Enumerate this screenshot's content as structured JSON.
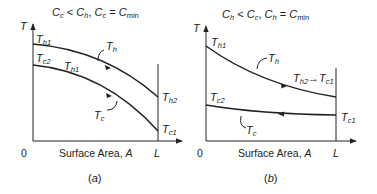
{
  "panels": [
    {
      "id": "a",
      "title": {
        "C1": "C",
        "s1": "c",
        "op1": " < ",
        "C2": "C",
        "s2": "h",
        "sep": ", ",
        "C3": "C",
        "s3": "c",
        "eq": " = ",
        "C4": "C",
        "s4": "min"
      },
      "y_axis_label": "T",
      "x_axis_label": "Surface Area, ",
      "x_axis_var": "A",
      "origin_label": "0",
      "end_label": "L",
      "caption_open": "(",
      "caption_letter": "a",
      "caption_close": ")",
      "labels": {
        "th1_top": {
          "T": "T",
          "sub": "h1"
        },
        "tc2": {
          "T": "T",
          "sub": "c2"
        },
        "th1_mid": {
          "T": "T",
          "sub": "h1"
        },
        "th": {
          "T": "T",
          "sub": "h"
        },
        "tc": {
          "T": "T",
          "sub": "c"
        },
        "th2": {
          "T": "T",
          "sub": "h2"
        },
        "tc1": {
          "T": "T",
          "sub": "c1"
        }
      }
    },
    {
      "id": "b",
      "title": {
        "C1": "C",
        "s1": "h",
        "op1": " < ",
        "C2": "C",
        "s2": "c",
        "sep": ", ",
        "C3": "C",
        "s3": "h",
        "eq": " = ",
        "C4": "C",
        "s4": "min"
      },
      "y_axis_label": "T",
      "x_axis_label": "Surface Area, ",
      "x_axis_var": "A",
      "origin_label": "0",
      "end_label": "L",
      "caption_open": "(",
      "caption_letter": "b",
      "caption_close": ")",
      "labels": {
        "th1": {
          "T": "T",
          "sub": "h1"
        },
        "th": {
          "T": "T",
          "sub": "h"
        },
        "th2": {
          "T": "T",
          "sub": "h2"
        },
        "arrow_to": "→",
        "tc1_top": {
          "T": "T",
          "sub": "c1"
        },
        "tc2": {
          "T": "T",
          "sub": "c2"
        },
        "tc": {
          "T": "T",
          "sub": "c"
        },
        "tc1": {
          "T": "T",
          "sub": "c1"
        }
      }
    }
  ],
  "colors": {
    "ink": "#222222",
    "background": "#ffffff"
  }
}
